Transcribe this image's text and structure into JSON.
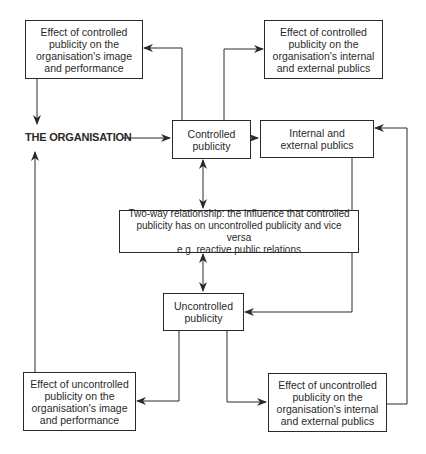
{
  "diagram": {
    "nodes": {
      "effect_controlled_image": {
        "text": "Effect of controlled\npublicity on the\norganisation's image\nand performance"
      },
      "effect_controlled_publics": {
        "text": "Effect of controlled\npublicity on the\norganisation's internal\nand external publics"
      },
      "organisation": {
        "text": "THE ORGANISATION"
      },
      "controlled_publicity": {
        "text": "Controlled\npublicity"
      },
      "internal_external_publics": {
        "text": "Internal and\nexternal publics"
      },
      "two_way": {
        "text": "Two-way relationship:  the influence that controlled\npublicity has on uncontrolled publicity and vice versa\ne.g. reactive public relations"
      },
      "uncontrolled_publicity": {
        "text": "Uncontrolled\npublicity"
      },
      "effect_uncontrolled_image": {
        "text": "Effect of uncontrolled\npublicity on the\norganisation's image\nand performance"
      },
      "effect_uncontrolled_publics": {
        "text": "Effect of uncontrolled\npublicity on the\norganisation's internal\nand external publics"
      }
    },
    "edges": [
      {
        "from": "controlled_publicity",
        "to": "effect_controlled_image"
      },
      {
        "from": "controlled_publicity",
        "to": "effect_controlled_publics"
      },
      {
        "from": "effect_controlled_image",
        "to": "organisation"
      },
      {
        "from": "organisation",
        "to": "controlled_publicity"
      },
      {
        "from": "controlled_publicity",
        "to": "internal_external_publics"
      },
      {
        "from": "controlled_publicity",
        "to": "two_way",
        "bidirectional": true
      },
      {
        "from": "two_way",
        "to": "uncontrolled_publicity",
        "bidirectional": true
      },
      {
        "from": "internal_external_publics",
        "to": "uncontrolled_publicity"
      },
      {
        "from": "uncontrolled_publicity",
        "to": "effect_uncontrolled_image"
      },
      {
        "from": "uncontrolled_publicity",
        "to": "effect_uncontrolled_publics"
      },
      {
        "from": "effect_uncontrolled_image",
        "to": "organisation"
      },
      {
        "from": "effect_uncontrolled_publics",
        "to": "internal_external_publics"
      }
    ],
    "line_color": "#2a2a2a"
  }
}
